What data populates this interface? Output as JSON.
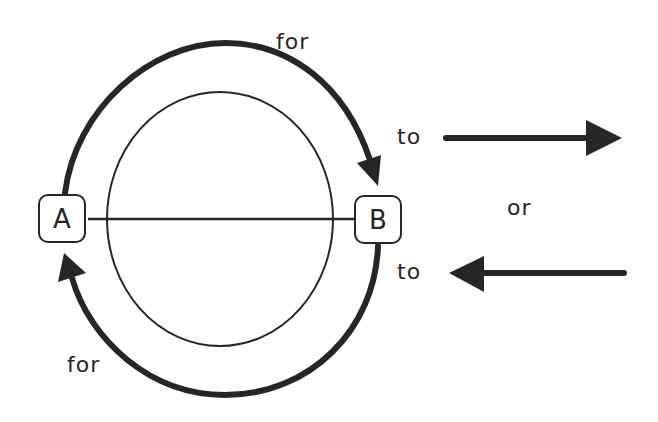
{
  "diagram": {
    "nodes": [
      {
        "id": "A",
        "label": "A"
      },
      {
        "id": "B",
        "label": "B"
      }
    ],
    "arc_labels": {
      "top": "for",
      "bottom": "for"
    },
    "direction_labels": {
      "right_arrow": "to",
      "left_arrow": "to",
      "separator": "or"
    },
    "colors": {
      "stroke": "#262626",
      "background": "#ffffff"
    }
  }
}
